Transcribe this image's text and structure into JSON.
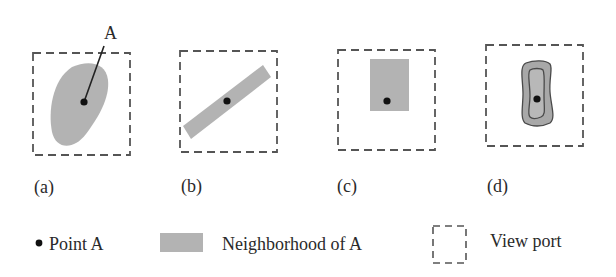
{
  "figure": {
    "colors": {
      "neighborhood_fill": "#b3b3b3",
      "contour_stroke": "#4a4a4a",
      "point": "#111111",
      "viewport_stroke": "#555555"
    },
    "panels": [
      {
        "id": "a",
        "label": "(a)",
        "shape": "irregular blob",
        "point_label": "A"
      },
      {
        "id": "b",
        "label": "(b)",
        "shape": "rotated rectangle"
      },
      {
        "id": "c",
        "label": "(c)",
        "shape": "rectangle, point off-center"
      },
      {
        "id": "d",
        "label": "(d)",
        "shape": "nested contours"
      }
    ],
    "legend": [
      {
        "symbol": "point",
        "label": "Point A"
      },
      {
        "symbol": "gray-rectangle",
        "label": "Neighborhood of A"
      },
      {
        "symbol": "dashed-box",
        "label": "View port"
      }
    ]
  }
}
